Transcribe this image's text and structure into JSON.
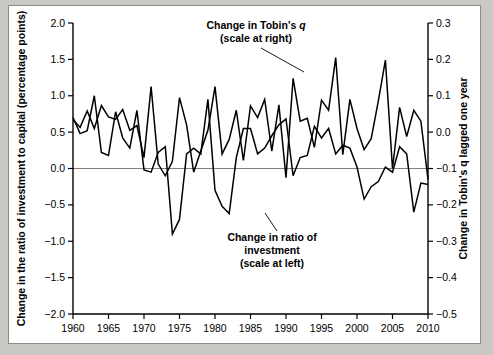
{
  "figure": {
    "background": "#ffffff",
    "outer_background": "#c8c8c4",
    "border_color": "#8a8a88"
  },
  "chart_data": {
    "type": "line",
    "title": "",
    "xlabel": "",
    "ylabel": "Change in the ratio of investment to capital (percentage points)",
    "y2label": "Change in Tobin's q lagged one year",
    "xlim": [
      1960,
      2010
    ],
    "xticks": [
      1960,
      1965,
      1970,
      1975,
      1980,
      1985,
      1990,
      1995,
      2000,
      2005,
      2010
    ],
    "xticklabels": [
      "1960",
      "1965",
      "1970",
      "1975",
      "1980",
      "1985",
      "1990",
      "1995",
      "2000",
      "2005",
      "2010"
    ],
    "ylim": [
      -2.0,
      2.0
    ],
    "yticks": [
      -2.0,
      -1.5,
      -1.0,
      -0.5,
      0.0,
      0.5,
      1.0,
      1.5,
      2.0
    ],
    "yticklabels": [
      "−2.0",
      "−1.5",
      "−1.0",
      "−0.5",
      "0.0",
      "0.5",
      "1.0",
      "1.5",
      "2.0"
    ],
    "y2lim": [
      -0.5,
      0.3
    ],
    "y2ticks": [
      -0.5,
      -0.4,
      -0.3,
      -0.2,
      -0.1,
      0.0,
      0.1,
      0.2,
      0.3
    ],
    "y2ticklabels": [
      "−0.5",
      "−0.4",
      "−0.3",
      "−0.2",
      "−0.1",
      "0.0",
      "0.1",
      "0.2",
      "0.3"
    ],
    "grid": false,
    "zero_line": true,
    "zero_line_color": "#808080",
    "legend": "annotations",
    "line_color": "#000000",
    "series": [
      {
        "name": "Change in ratio of investment",
        "axis": "left",
        "x": [
          1960,
          1961,
          1962,
          1963,
          1964,
          1965,
          1966,
          1967,
          1968,
          1969,
          1970,
          1971,
          1972,
          1973,
          1974,
          1975,
          1976,
          1977,
          1978,
          1979,
          1980,
          1981,
          1982,
          1983,
          1984,
          1985,
          1986,
          1987,
          1988,
          1989,
          1990,
          1991,
          1992,
          1993,
          1994,
          1995,
          1996,
          1997,
          1998,
          1999,
          2000,
          2001,
          2002,
          2003,
          2004,
          2005,
          2006,
          2007,
          2008,
          2009,
          2010
        ],
        "values": [
          0.7,
          0.48,
          0.52,
          1.0,
          0.22,
          0.18,
          0.78,
          0.42,
          0.28,
          0.8,
          -0.02,
          -0.05,
          0.22,
          0.3,
          -0.9,
          -0.7,
          0.2,
          0.28,
          0.2,
          0.95,
          -0.3,
          -0.52,
          -0.62,
          0.15,
          0.55,
          0.55,
          0.2,
          0.28,
          0.45,
          0.6,
          0.68,
          -0.1,
          0.15,
          0.18,
          0.58,
          0.42,
          0.55,
          0.2,
          0.32,
          0.28,
          0.02,
          -0.42,
          -0.25,
          -0.18,
          0.02,
          -0.05,
          0.3,
          0.2,
          -0.6,
          -0.2,
          -0.22
        ]
      },
      {
        "name": "Change in Tobin's q",
        "axis": "right",
        "x": [
          1960,
          1961,
          1962,
          1963,
          1964,
          1965,
          1966,
          1967,
          1968,
          1969,
          1970,
          1971,
          1972,
          1973,
          1974,
          1975,
          1976,
          1977,
          1978,
          1979,
          1980,
          1981,
          1982,
          1983,
          1984,
          1985,
          1986,
          1987,
          1988,
          1989,
          1990,
          1991,
          1992,
          1993,
          1994,
          1995,
          1996,
          1997,
          1998,
          1999,
          2000,
          2001,
          2002,
          2003,
          2004,
          2005,
          2006,
          2007,
          2008,
          2009,
          2010
        ],
        "values": [
          0.035,
          0.013,
          0.058,
          0.01,
          0.073,
          0.042,
          0.035,
          0.062,
          0.005,
          0.018,
          -0.07,
          0.125,
          -0.088,
          -0.12,
          -0.08,
          0.095,
          0.02,
          -0.11,
          -0.052,
          0.005,
          0.125,
          -0.06,
          -0.02,
          0.06,
          -0.078,
          0.072,
          0.04,
          0.09,
          -0.052,
          0.075,
          -0.125,
          0.148,
          0.03,
          0.038,
          -0.042,
          0.088,
          0.06,
          0.205,
          -0.062,
          0.09,
          0.01,
          -0.048,
          -0.018,
          0.085,
          0.198,
          -0.1,
          0.068,
          -0.012,
          0.06,
          0.03,
          -0.13
        ]
      }
    ],
    "annotations": [
      {
        "id": "tobins-q-annotation",
        "lines": [
          "Change in Tobin’s q",
          "(scale at right)"
        ],
        "emphasis": "q",
        "leader": "to peak near 1991"
      },
      {
        "id": "investment-annotation",
        "lines": [
          "Change in ratio of",
          "investment",
          "(scale at left)"
        ],
        "leader": "to trough near 1998"
      }
    ]
  }
}
